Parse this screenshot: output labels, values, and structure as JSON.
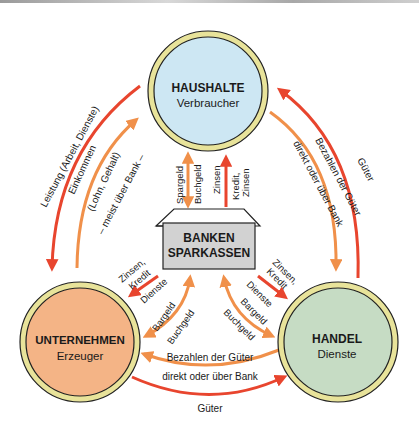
{
  "colors": {
    "red": "#e8452e",
    "orange": "#f0904a",
    "ring": "#e8e39a",
    "haushalte_fill": "#cde7f3",
    "unternehmen_fill": "#f4b486",
    "handel_fill": "#c6dcc4",
    "bank_fill": "#d2d2d2"
  },
  "nodes": {
    "haushalte": {
      "title": "HAUSHALTE",
      "subtitle": "Verbraucher"
    },
    "unternehmen": {
      "title": "UNTERNEHMEN",
      "subtitle": "Erzeuger"
    },
    "handel": {
      "title": "HANDEL",
      "subtitle": "Dienste"
    },
    "bank": {
      "line1": "BANKEN",
      "line2": "SPARKASSEN"
    }
  },
  "flows": {
    "left_outer": "Leistung (Arbeit, Dienste)",
    "left_inner_1": "Einkommen",
    "left_inner_2": "(Lohn, Gehalt)",
    "left_inner_3": "– meist über Bank –",
    "right_outer": "Güter",
    "right_inner_1": "Bezahlen der Güter",
    "right_inner_2": "direkt oder über Bank",
    "bottom_inner_1": "Bezahlen der Güter",
    "bottom_inner_2": "direkt oder über Bank",
    "bottom_outer": "Güter",
    "hh_bank_1": "Spargeld",
    "hh_bank_2": "Buchgeld",
    "hh_bank_3": "Zinsen",
    "hh_bank_4a": "Kredit,",
    "hh_bank_4b": "Zinsen",
    "ue_bank_red_a": "Zinsen,",
    "ue_bank_red_b": "Kredit",
    "ue_bank_dienste": "Dienste",
    "ue_bank_bargeld": "Bargeld",
    "ue_bank_buchgeld": "Buchgeld",
    "ha_bank_red_a": "Zinsen,",
    "ha_bank_red_b": "Kredit",
    "ha_bank_dienste": "Dienste",
    "ha_bank_bargeld": "Bargeld",
    "ha_bank_buchgeld": "Buchgeld"
  }
}
